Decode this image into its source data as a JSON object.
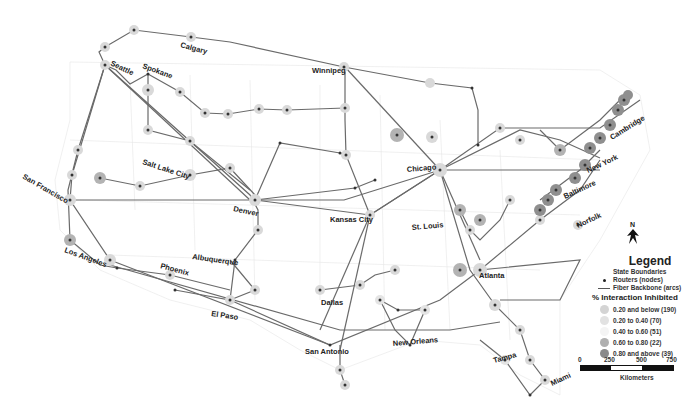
{
  "map": {
    "title": "Fiber backbone network with % interaction inhibited",
    "cities": [
      {
        "name": "Calgary",
        "x": 180,
        "y": 47,
        "rot": 15
      },
      {
        "name": "Seattle",
        "x": 110,
        "y": 65,
        "rot": 25
      },
      {
        "name": "Spokane",
        "x": 142,
        "y": 68,
        "rot": 20
      },
      {
        "name": "Winnipeg",
        "x": 312,
        "y": 73,
        "rot": 0
      },
      {
        "name": "Salt Lake City",
        "x": 142,
        "y": 164,
        "rot": 18
      },
      {
        "name": "San Francisco",
        "x": 22,
        "y": 178,
        "rot": 30
      },
      {
        "name": "Chicago",
        "x": 407,
        "y": 172,
        "rot": -5
      },
      {
        "name": "Cambridge",
        "x": 612,
        "y": 140,
        "rot": -32
      },
      {
        "name": "New York",
        "x": 588,
        "y": 173,
        "rot": -25
      },
      {
        "name": "Baltimore",
        "x": 565,
        "y": 199,
        "rot": -25
      },
      {
        "name": "Denver",
        "x": 233,
        "y": 211,
        "rot": 12
      },
      {
        "name": "Kansas City",
        "x": 330,
        "y": 222,
        "rot": 0
      },
      {
        "name": "St. Louis",
        "x": 412,
        "y": 230,
        "rot": -5
      },
      {
        "name": "Norfolk",
        "x": 578,
        "y": 228,
        "rot": -25
      },
      {
        "name": "Los Angeles",
        "x": 64,
        "y": 252,
        "rot": 20
      },
      {
        "name": "Albuquerque",
        "x": 192,
        "y": 259,
        "rot": 8
      },
      {
        "name": "Phoenix",
        "x": 160,
        "y": 268,
        "rot": 15
      },
      {
        "name": "El Paso",
        "x": 211,
        "y": 316,
        "rot": 8
      },
      {
        "name": "Dallas",
        "x": 321,
        "y": 305,
        "rot": 0
      },
      {
        "name": "Atlanta",
        "x": 479,
        "y": 278,
        "rot": 0
      },
      {
        "name": "San Antonio",
        "x": 305,
        "y": 354,
        "rot": 0
      },
      {
        "name": "New Orleans",
        "x": 393,
        "y": 346,
        "rot": -5
      },
      {
        "name": "Tampa",
        "x": 494,
        "y": 363,
        "rot": -15
      },
      {
        "name": "Miami",
        "x": 552,
        "y": 386,
        "rot": -25
      }
    ]
  },
  "legend": {
    "title": "Legend",
    "items": [
      {
        "label": "State Boundaries",
        "symbol": "none"
      },
      {
        "label": "Routers (nodes)",
        "symbol": "dot"
      },
      {
        "label": "Fiber Backbone (arcs)",
        "symbol": "line"
      }
    ],
    "subtitle": "% Interaction Inhibited",
    "classes": [
      {
        "label": "0.20 and below (190)",
        "color": "#d4d4d4"
      },
      {
        "label": "0.20 to 0.40 (70)",
        "color": "#e2e2e2"
      },
      {
        "label": "0.40 to 0.60 (51)",
        "color": "#f4f4f4"
      },
      {
        "label": "0.60 to 0.80 (22)",
        "color": "#b0b0b0"
      },
      {
        "label": "0.80 and above (39)",
        "color": "#8a8a8a"
      }
    ]
  },
  "scale_bar": {
    "ticks": [
      "0",
      "250",
      "500",
      "750"
    ],
    "unit": "Kilometers"
  },
  "north_arrow": {
    "label": "N"
  }
}
